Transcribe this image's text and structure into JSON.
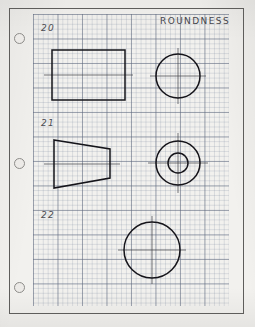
{
  "sheet": {
    "width": 255,
    "height": 327,
    "paper_color": "#f2f1ee",
    "border_color": "#5e5d5b",
    "ink_color": "#15141a",
    "grid_color": "#6e7d96"
  },
  "title": {
    "text": "ROUNDNESS"
  },
  "punch_holes": [
    {
      "name": "punch-hole-top",
      "cx": 19,
      "cy": 38
    },
    {
      "name": "punch-hole-middle",
      "cx": 19,
      "cy": 163
    },
    {
      "name": "punch-hole-bottom",
      "cx": 19,
      "cy": 287
    }
  ],
  "problems": [
    {
      "number": "20",
      "label_x": 41,
      "label_y": 23,
      "views": [
        {
          "name": "rectangle-front-view",
          "shape": "rectangle"
        },
        {
          "name": "circle-side-view",
          "shape": "circle"
        }
      ]
    },
    {
      "number": "21",
      "label_x": 41,
      "label_y": 118,
      "views": [
        {
          "name": "tapered-frustum-front-view",
          "shape": "trapezoid"
        },
        {
          "name": "concentric-circles-side-view",
          "shape": "concentric-circles"
        }
      ]
    },
    {
      "number": "22",
      "label_x": 41,
      "label_y": 210,
      "views": [
        {
          "name": "large-circle-view",
          "shape": "circle"
        }
      ]
    }
  ],
  "geometry": {
    "problem_20": {
      "rectangle": {
        "x": 52,
        "y": 50,
        "width": 73,
        "height": 50
      },
      "rect_centerline": {
        "x1": 44,
        "y1": 75,
        "x2": 133,
        "y2": 75
      },
      "circle": {
        "cx": 178,
        "cy": 76,
        "r": 22
      },
      "circle_centerline_h": {
        "x1": 150,
        "y1": 76,
        "x2": 206,
        "y2": 76
      },
      "circle_centerline_v": {
        "x1": 178,
        "y1": 48,
        "x2": 178,
        "y2": 104
      }
    },
    "problem_21": {
      "trapezoid": {
        "points": "54,140 110,149 110,178 54,188"
      },
      "trap_centerline": {
        "x1": 44,
        "y1": 164,
        "x2": 120,
        "y2": 164
      },
      "circle_outer": {
        "cx": 178,
        "cy": 163,
        "r": 22
      },
      "circle_inner": {
        "cx": 178,
        "cy": 163,
        "r": 10
      },
      "circle_centerline_h": {
        "x1": 148,
        "y1": 163,
        "x2": 208,
        "y2": 163
      },
      "circle_centerline_v": {
        "x1": 178,
        "y1": 133,
        "x2": 178,
        "y2": 193
      }
    },
    "problem_22": {
      "circle": {
        "cx": 152,
        "cy": 250,
        "r": 28
      },
      "circle_centerline_h": {
        "x1": 118,
        "y1": 250,
        "x2": 186,
        "y2": 250
      },
      "circle_centerline_v": {
        "x1": 152,
        "y1": 216,
        "x2": 152,
        "y2": 284
      }
    }
  },
  "grid": {
    "left": 33,
    "top": 14,
    "width": 196,
    "height": 292,
    "fine_spacing": 4.9,
    "heavy_spacing": 24.5
  }
}
